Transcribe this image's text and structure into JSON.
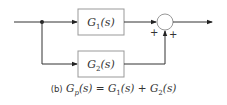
{
  "diagram": {
    "type": "block-diagram",
    "blocks": [
      {
        "id": "g1",
        "label": "G",
        "subscript": "1",
        "arg": "(s)"
      },
      {
        "id": "g2",
        "label": "G",
        "subscript": "2",
        "arg": "(s)"
      }
    ],
    "summing_junction": {
      "signs": [
        "+",
        "+"
      ]
    },
    "colors": {
      "line": "#333333",
      "box_border": "#999999"
    }
  },
  "caption": {
    "tag": "(b)",
    "equation": "Gp(s) = G1(s) + G2(s)",
    "lhs": "G",
    "lhs_sub": "p",
    "lhs_arg": "(s)",
    "equals": "=",
    "t1": "G",
    "t1_sub": "1",
    "t1_arg": "(s)",
    "plus": "+",
    "t2": "G",
    "t2_sub": "2",
    "t2_arg": "(s)"
  }
}
